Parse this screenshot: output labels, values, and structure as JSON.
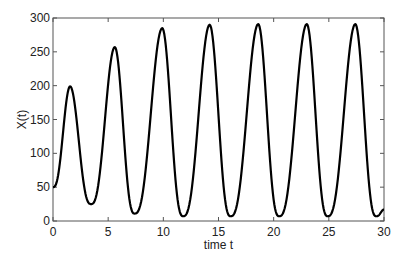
{
  "chart_data": {
    "type": "line",
    "title": "",
    "xlabel": "time t",
    "ylabel": "X(t)",
    "xlim": [
      0,
      30
    ],
    "ylim": [
      0,
      300
    ],
    "xticks": [
      0,
      5,
      10,
      15,
      20,
      25,
      30
    ],
    "yticks": [
      0,
      50,
      100,
      150,
      200,
      250,
      300
    ],
    "xtick_labels": [
      "0",
      "5",
      "10",
      "15",
      "20",
      "25",
      "30"
    ],
    "ytick_labels": [
      "0",
      "50",
      "100",
      "150",
      "200",
      "250",
      "300"
    ],
    "grid": false,
    "legend": null,
    "series": [
      {
        "name": "X(t)",
        "color": "#000000",
        "keypoints": [
          {
            "t": 0.0,
            "x": 50
          },
          {
            "t": 1.55,
            "x": 199
          },
          {
            "t": 3.45,
            "x": 25
          },
          {
            "t": 5.6,
            "x": 257
          },
          {
            "t": 7.4,
            "x": 11
          },
          {
            "t": 9.9,
            "x": 285
          },
          {
            "t": 11.8,
            "x": 7
          },
          {
            "t": 14.2,
            "x": 290
          },
          {
            "t": 16.1,
            "x": 7
          },
          {
            "t": 18.6,
            "x": 291
          },
          {
            "t": 20.5,
            "x": 7
          },
          {
            "t": 23.0,
            "x": 291
          },
          {
            "t": 24.9,
            "x": 7
          },
          {
            "t": 27.4,
            "x": 291
          },
          {
            "t": 29.3,
            "x": 7
          },
          {
            "t": 30.0,
            "x": 17
          }
        ]
      }
    ]
  },
  "layout": {
    "plot_left": 53,
    "plot_top": 18,
    "plot_right": 384,
    "plot_bottom": 221
  }
}
